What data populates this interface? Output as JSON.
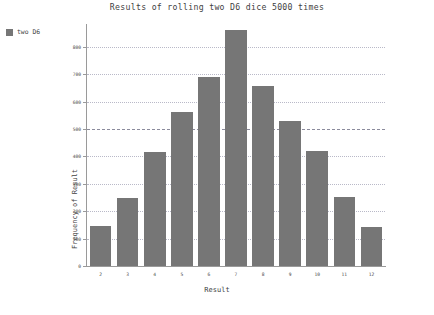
{
  "chart_data": {
    "type": "bar",
    "title": "Results of rolling two D6 dice 5000 times",
    "xlabel": "Result",
    "ylabel": "Frequency of Result",
    "categories": [
      "2",
      "3",
      "4",
      "5",
      "6",
      "7",
      "8",
      "9",
      "10",
      "11",
      "12"
    ],
    "values": [
      145,
      250,
      417,
      562,
      689,
      863,
      656,
      529,
      420,
      253,
      141
    ],
    "series": [
      {
        "name": "two D6",
        "values": [
          145,
          250,
          417,
          562,
          689,
          863,
          656,
          529,
          420,
          253,
          141
        ],
        "color": "#767676"
      }
    ],
    "ylim": [
      0,
      880
    ],
    "yticks": [
      0,
      100,
      200,
      300,
      400,
      500,
      600,
      700,
      800
    ],
    "ytick_labels": [
      "0",
      "100",
      "200",
      "300",
      "400",
      "500",
      "600",
      "700",
      "800"
    ],
    "grid": true,
    "grid_major_value": 500,
    "legend": {
      "position": "top-left-outside",
      "entries": [
        {
          "label": "two D6",
          "color": "#767676"
        }
      ]
    }
  },
  "colors": {
    "bar": "#767676",
    "grid": "#b9b9c8",
    "grid_major": "#8b8b9c",
    "axis": "#9a9a9a",
    "text": "#3f3f3f",
    "background": "#ffffff"
  }
}
